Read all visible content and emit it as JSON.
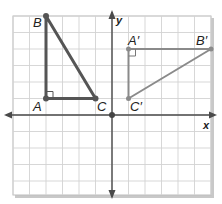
{
  "figure": {
    "type": "coordinate-plane-rotation",
    "grid": {
      "x_min": -6,
      "x_max": 6,
      "y_min": -4.85,
      "y_max": 6
    },
    "axes": {
      "x_label": "x",
      "y_label": "y"
    },
    "colors": {
      "grid": "#cfcfcf",
      "axis": "#4a4a4a",
      "preimage": "#555555",
      "image": "#8a8a8a",
      "border_shadow": "#bdbdbd"
    },
    "preimage": {
      "name": "triangle-ABC",
      "points": [
        {
          "label": "A",
          "x": -4,
          "y": 1
        },
        {
          "label": "B",
          "x": -4,
          "y": 6
        },
        {
          "label": "C",
          "x": -1,
          "y": 1
        }
      ],
      "right_angle_at": "A"
    },
    "image": {
      "name": "triangle-A'B'C'",
      "points": [
        {
          "label": "A′",
          "x": 1,
          "y": 4
        },
        {
          "label": "B′",
          "x": 6,
          "y": 4
        },
        {
          "label": "C′",
          "x": 1,
          "y": 1
        }
      ],
      "right_angle_at": "A′"
    },
    "origin_marked": true
  }
}
